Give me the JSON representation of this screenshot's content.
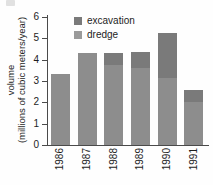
{
  "chart_data": {
    "type": "bar",
    "subtype": "stacked-bar",
    "title": "",
    "xlabel": "",
    "ylabel": "volume (millions of cubic meters/year)",
    "ylabel_lines": [
      "volume",
      "(millions of cubic meters/year)"
    ],
    "categories": [
      "1986",
      "1987",
      "1988",
      "1989",
      "1990",
      "1991"
    ],
    "series": [
      {
        "name": "dredge",
        "values": [
          3.35,
          4.33,
          3.75,
          3.6,
          3.15,
          2.0
        ]
      },
      {
        "name": "excavation",
        "values": [
          0.0,
          0.0,
          0.58,
          0.78,
          2.12,
          0.57
        ]
      }
    ],
    "totals": [
      3.35,
      4.33,
      4.33,
      4.38,
      5.27,
      2.57
    ],
    "ylim": [
      0,
      6
    ],
    "yticks": [
      0,
      1,
      2,
      3,
      4,
      5,
      6
    ],
    "ytick_labels": [
      "0",
      "1",
      "2",
      "3",
      "4",
      "5",
      "6"
    ],
    "grid": false,
    "legend_position": "top-center-inside",
    "xtick_rotation": -90,
    "colors": {
      "excavation": "#7a7a7a",
      "dredge": "#8d8d8d",
      "axis": "#4a4a4a",
      "text": "#1d1d1d",
      "background": "#fefefe"
    }
  },
  "legend": {
    "items": [
      {
        "label": "excavation",
        "swatch_class": "sw-exc"
      },
      {
        "label": "dredge",
        "swatch_class": "sw-dredge"
      }
    ]
  }
}
